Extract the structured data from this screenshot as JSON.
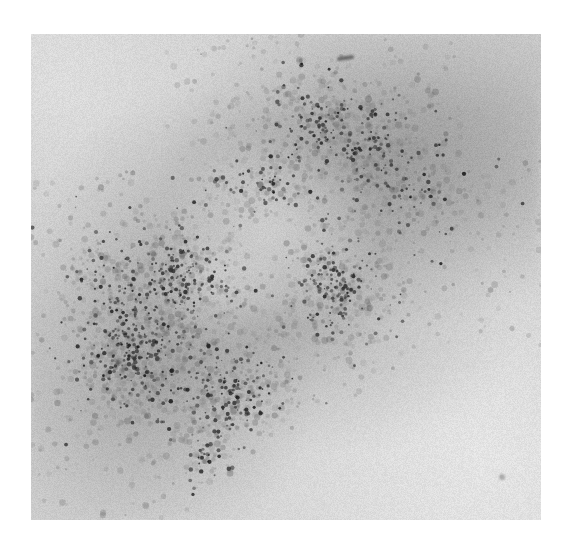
{
  "figure": {
    "kind": "micrograph",
    "modality": "autoradiograph",
    "caption": "",
    "page_background": "#ffffff",
    "panel": {
      "name": "micrograph-panel",
      "left": 31,
      "top": 34,
      "width": 510,
      "height": 486,
      "background": "#cfcfcf",
      "border": "none"
    },
    "tones": {
      "paper_white": "#ffffff",
      "panel_light": "#dcdcdc",
      "panel_mid": "#cbcbcb",
      "haze_dark": "#8a8a8a",
      "grain_dark": "#2b2b2b",
      "grain_mid": "#595959"
    },
    "structures": [
      {
        "name": "labelled-cell-body",
        "description": "elongated oval running lower-left to upper-right",
        "center_pct": [
          48,
          48
        ],
        "angle_deg": -38
      },
      {
        "name": "dense-grain-zone-lower-left",
        "center_pct": [
          22,
          70
        ],
        "radius_pct": 24,
        "density": "high"
      },
      {
        "name": "dark-haze-zone-upper-right",
        "center_pct": [
          72,
          27
        ],
        "radius_pct": 30,
        "density": "medium"
      },
      {
        "name": "interior-clearing",
        "center_pct": [
          47,
          40
        ],
        "radius_pct": 15,
        "density": "low"
      },
      {
        "name": "background-clear-lower-right",
        "center_pct": [
          85,
          85
        ],
        "radius_pct": 28,
        "density": "none"
      }
    ],
    "artifacts": [
      {
        "name": "top-scan-mark",
        "x_pct": 60,
        "y_pct": 4.5
      },
      {
        "name": "lower-right-speck",
        "x_pct": 92,
        "y_pct": 90
      }
    ],
    "grain_field": {
      "seed": 20240517,
      "count_dark": 1050,
      "count_mid": 2400,
      "radius_px": [
        0.8,
        2.6
      ],
      "hotspots": [
        {
          "x_pct": 20,
          "y_pct": 66,
          "r_pct": 22,
          "weight": 1.0
        },
        {
          "x_pct": 30,
          "y_pct": 50,
          "r_pct": 20,
          "weight": 0.92
        },
        {
          "x_pct": 40,
          "y_pct": 74,
          "r_pct": 20,
          "weight": 0.88
        },
        {
          "x_pct": 46,
          "y_pct": 34,
          "r_pct": 19,
          "weight": 0.74
        },
        {
          "x_pct": 60,
          "y_pct": 52,
          "r_pct": 22,
          "weight": 0.8
        },
        {
          "x_pct": 66,
          "y_pct": 24,
          "r_pct": 22,
          "weight": 0.72
        },
        {
          "x_pct": 56,
          "y_pct": 16,
          "r_pct": 17,
          "weight": 0.6
        },
        {
          "x_pct": 78,
          "y_pct": 34,
          "r_pct": 17,
          "weight": 0.5
        },
        {
          "x_pct": 35,
          "y_pct": 88,
          "r_pct": 15,
          "weight": 0.46
        },
        {
          "x_pct": 14,
          "y_pct": 50,
          "r_pct": 14,
          "weight": 0.44
        }
      ],
      "coldspots": [
        {
          "x_pct": 47,
          "y_pct": 40,
          "r_pct": 14,
          "weight": 0.62
        },
        {
          "x_pct": 88,
          "y_pct": 86,
          "r_pct": 30,
          "weight": 0.95
        },
        {
          "x_pct": 10,
          "y_pct": 12,
          "r_pct": 22,
          "weight": 0.9
        },
        {
          "x_pct": 50,
          "y_pct": 97,
          "r_pct": 24,
          "weight": 0.88
        },
        {
          "x_pct": 94,
          "y_pct": 12,
          "r_pct": 16,
          "weight": 0.55
        }
      ]
    }
  }
}
